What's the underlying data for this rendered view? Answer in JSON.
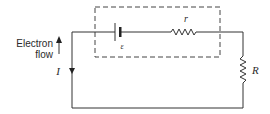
{
  "diagram": {
    "title": "",
    "type": "circuit",
    "labels": {
      "electron_flow_line1": "Electron",
      "electron_flow_line2": "flow",
      "current": "I",
      "emf": "ε",
      "internal_resistance": "r",
      "external_resistance": "R"
    },
    "components": [
      {
        "id": "cell",
        "kind": "battery",
        "label": "ε",
        "inside_dashed_box": true
      },
      {
        "id": "internal-resistor",
        "kind": "resistor",
        "label": "r",
        "inside_dashed_box": true
      },
      {
        "id": "load-resistor",
        "kind": "resistor",
        "label": "R",
        "inside_dashed_box": false
      }
    ],
    "arrows": [
      {
        "id": "electron-flow-arrow",
        "direction": "up"
      },
      {
        "id": "current-arrow",
        "direction": "down",
        "label": "I"
      }
    ],
    "colors": {
      "stroke": "#333333",
      "background": "#ffffff"
    }
  }
}
